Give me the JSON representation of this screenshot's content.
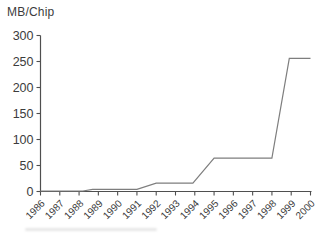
{
  "chart_data": {
    "type": "line",
    "title": "",
    "ylabel": "MB/Chip",
    "xlabel": "",
    "categories": [
      "1986",
      "1987",
      "1988",
      "1989",
      "1990",
      "1991",
      "1992",
      "1993",
      "1994",
      "1995",
      "1996",
      "1997",
      "1998",
      "1999",
      "2000"
    ],
    "values": [
      1,
      1,
      1,
      4,
      4,
      4,
      16,
      16,
      16,
      64,
      64,
      64,
      64,
      256,
      256
    ],
    "series": [
      {
        "name": "MB per chip",
        "points": [
          [
            1986,
            1
          ],
          [
            1988.2,
            1
          ],
          [
            1988.7,
            4
          ],
          [
            1991,
            4
          ],
          [
            1992,
            16
          ],
          [
            1993.9,
            16
          ],
          [
            1995,
            64
          ],
          [
            1998,
            64
          ],
          [
            1998.9,
            256
          ],
          [
            2000,
            256
          ]
        ]
      }
    ],
    "xlim": [
      1986,
      2000
    ],
    "ylim": [
      0,
      300
    ],
    "y_ticks": [
      0,
      50,
      100,
      150,
      200,
      250,
      300
    ],
    "grid": false,
    "legend": false,
    "colors": {
      "line": "#7e7e7e",
      "axis": "#4f4f4f",
      "text": "#3c3c3c",
      "background": "#ffffff"
    }
  }
}
